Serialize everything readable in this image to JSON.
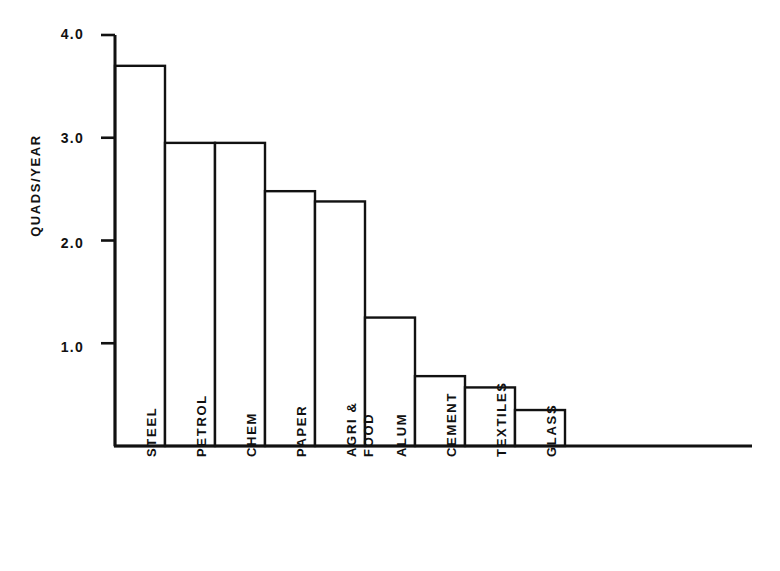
{
  "chart_data": {
    "type": "bar",
    "title": "",
    "xlabel": "",
    "ylabel": "QUADS/YEAR",
    "ylim": [
      0,
      4.0
    ],
    "grid": false,
    "legend": "none",
    "y_ticks": [
      "4.0",
      "3.0",
      "2.0",
      "1.0"
    ],
    "y_tick_values": [
      4.0,
      3.0,
      2.0,
      1.0
    ],
    "categories": [
      "STEEL",
      "PETROL",
      "CHEM",
      "PAPER",
      "AGRI & FOOD",
      "ALUM",
      "CEMENT",
      "TEXTILES",
      "GLASS"
    ],
    "category_lines": [
      [
        "STEEL"
      ],
      [
        "PETROL"
      ],
      [
        "CHEM"
      ],
      [
        "PAPER"
      ],
      [
        "AGRI &",
        "FOOD"
      ],
      [
        "ALUM"
      ],
      [
        "CEMENT"
      ],
      [
        "TEXTILES"
      ],
      [
        "GLASS"
      ]
    ],
    "values": [
      3.7,
      2.95,
      2.95,
      2.48,
      2.38,
      1.25,
      0.68,
      0.57,
      0.35
    ],
    "bar_style": "outline",
    "bar_fill": "#ffffff",
    "bar_stroke": "#111111"
  },
  "axis": {
    "line_color": "#111111",
    "baseline_label": "x-axis",
    "vertical_label": "y-axis"
  }
}
